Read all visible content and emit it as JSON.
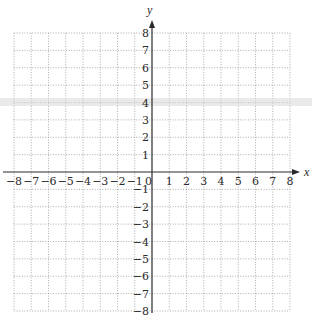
{
  "chart_data": {
    "type": "scatter",
    "title": "",
    "xlabel": "x",
    "ylabel": "y",
    "xlim": [
      -8,
      8
    ],
    "ylim": [
      -8,
      8
    ],
    "grid": true,
    "grid_style": "dotted",
    "x_ticks": [
      -8,
      -7,
      -6,
      -5,
      -4,
      -3,
      -2,
      -1,
      1,
      2,
      3,
      4,
      5,
      6,
      7,
      8
    ],
    "y_ticks": [
      -8,
      -7,
      -6,
      -5,
      -4,
      -3,
      -2,
      -1,
      1,
      2,
      3,
      4,
      5,
      6,
      7,
      8
    ],
    "x_tick_labels": [
      "−8",
      "−7",
      "−6",
      "−5",
      "−4",
      "−3",
      "−2",
      "−1",
      "1",
      "2",
      "3",
      "4",
      "5",
      "6",
      "7",
      "8"
    ],
    "y_tick_labels": [
      "−8",
      "−7",
      "−6",
      "−5",
      "−4",
      "−3",
      "−2",
      "−1",
      "1",
      "2",
      "3",
      "4",
      "5",
      "6",
      "7",
      "8"
    ],
    "origin_label": "0",
    "points": [],
    "colors": {
      "axis": "#2a2a2a",
      "grid": "#8a8a8a",
      "background": "#ffffff"
    }
  }
}
